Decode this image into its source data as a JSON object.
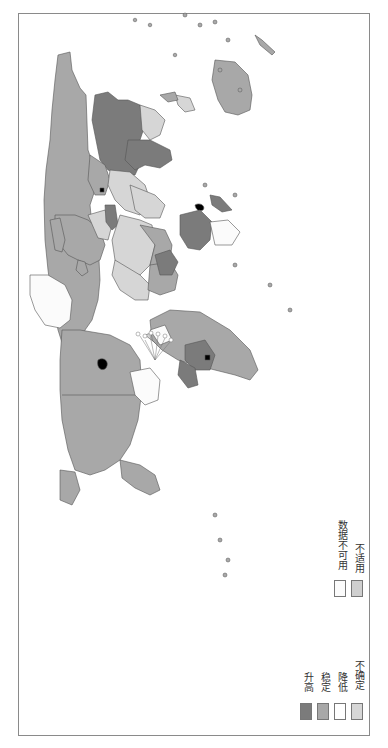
{
  "map": {
    "type": "choropleth",
    "subject": "World map, rotated 90° (north to the left)",
    "orientation": "rotated-counterclockwise"
  },
  "legend": {
    "items": [
      {
        "label": "升高",
        "color": "#7b7b7b"
      },
      {
        "label": "稳定",
        "color": "#a8a8a8"
      },
      {
        "label": "降低",
        "color": "#ffffff"
      },
      {
        "label": "不确定",
        "color": "#d6d6d6"
      },
      {
        "label": "数据不可用",
        "color": "#fbfbfb"
      },
      {
        "label": "不适用",
        "color": "#cfcfcf"
      }
    ]
  },
  "colors": {
    "increase": "#7b7b7b",
    "stable": "#a8a8a8",
    "decrease": "#ffffff",
    "uncertain": "#d6d6d6",
    "no_data": "#fbfbfb",
    "not_applicable": "#cfcfcf",
    "border": "#555555",
    "highlight": "#000000"
  }
}
